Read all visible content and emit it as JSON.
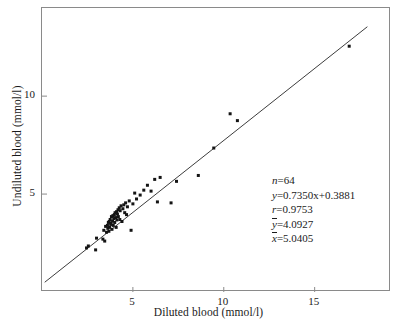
{
  "chart_data": {
    "type": "scatter",
    "title": "",
    "xlabel": "Diluted blood (mmol/l)",
    "ylabel": "Undiluted blood (mmol/l)",
    "xlim": [
      0,
      19.2
    ],
    "ylim": [
      0,
      14.5
    ],
    "xticks": [
      5,
      10,
      15
    ],
    "yticks": [
      5,
      10
    ],
    "xtick_labels": [
      "5",
      "10",
      "15"
    ],
    "ytick_labels": [
      "5",
      "10"
    ],
    "grid": false,
    "legend": "none",
    "series": [
      {
        "name": "blood glucose pairs",
        "marker": "filled-square",
        "color": "#141414",
        "x": [
          2.45,
          2.55,
          2.95,
          3.0,
          3.35,
          3.4,
          3.45,
          3.5,
          3.55,
          3.6,
          3.62,
          3.65,
          3.68,
          3.7,
          3.72,
          3.75,
          3.78,
          3.8,
          3.82,
          3.85,
          3.88,
          3.9,
          3.92,
          3.95,
          3.98,
          4.0,
          4.02,
          4.05,
          4.08,
          4.1,
          4.12,
          4.15,
          4.18,
          4.2,
          4.25,
          4.28,
          4.3,
          4.35,
          4.4,
          4.45,
          4.5,
          4.55,
          4.6,
          4.65,
          4.7,
          4.8,
          4.9,
          5.0,
          5.1,
          5.2,
          5.4,
          5.6,
          5.8,
          6.0,
          6.2,
          6.35,
          6.5,
          7.1,
          7.4,
          8.6,
          9.45,
          10.35,
          10.75,
          16.9
        ],
        "y": [
          2.25,
          2.35,
          2.15,
          2.75,
          2.7,
          3.15,
          2.6,
          3.35,
          3.05,
          3.4,
          3.25,
          3.55,
          3.1,
          3.6,
          3.3,
          3.7,
          3.45,
          3.5,
          3.85,
          3.2,
          3.62,
          3.9,
          3.4,
          3.75,
          3.95,
          3.55,
          4.05,
          3.8,
          3.3,
          4.1,
          3.68,
          3.98,
          4.2,
          3.85,
          4.3,
          3.7,
          4.15,
          4.4,
          3.6,
          4.25,
          4.45,
          4.05,
          4.55,
          3.95,
          4.35,
          4.65,
          3.15,
          4.5,
          5.05,
          4.75,
          4.95,
          5.2,
          5.45,
          5.15,
          5.75,
          4.6,
          5.85,
          4.55,
          5.65,
          5.95,
          7.35,
          9.1,
          8.75,
          12.55
        ]
      }
    ],
    "fit_line": {
      "slope": 0.735,
      "intercept": 0.3881,
      "x_start": 0.15,
      "x_end": 17.9,
      "color": "#3d3d3d"
    },
    "annotations": [
      {
        "id": "n",
        "var": "n",
        "overline": false,
        "rhs": "=64"
      },
      {
        "id": "regression",
        "var": "y",
        "overline": false,
        "rhs": "=0.7350x+0.3881"
      },
      {
        "id": "r",
        "var": "r",
        "overline": false,
        "rhs": "=0.9753"
      },
      {
        "id": "ybar",
        "var": "y",
        "overline": true,
        "rhs": "=4.0927"
      },
      {
        "id": "xbar",
        "var": "x",
        "overline": true,
        "rhs": "=5.0405"
      }
    ]
  },
  "colors": {
    "frame": "#8a8a8a",
    "marker": "#141414",
    "line": "#3d3d3d",
    "text": "#1a1a1a",
    "background": "#ffffff"
  }
}
